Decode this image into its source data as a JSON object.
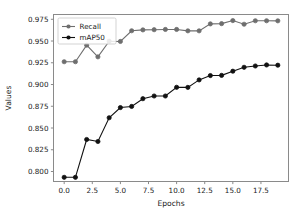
{
  "chart_data": {
    "type": "line",
    "title": "",
    "xlabel": "Epochs",
    "ylabel": "Values",
    "xlim": [
      -0.95,
      19.95
    ],
    "ylim": [
      0.7885,
      0.9805
    ],
    "xticks": [
      0.0,
      2.5,
      5.0,
      7.5,
      10.0,
      12.5,
      15.0,
      17.5
    ],
    "xticklabels": [
      "0.0",
      "2.5",
      "5.0",
      "7.5",
      "10.0",
      "12.5",
      "15.0",
      "17.5"
    ],
    "yticks": [
      0.8,
      0.825,
      0.85,
      0.875,
      0.9,
      0.925,
      0.95,
      0.975
    ],
    "yticklabels": [
      "0.800",
      "0.825",
      "0.850",
      "0.875",
      "0.900",
      "0.925",
      "0.950",
      "0.975"
    ],
    "grid": false,
    "legend_position": "upper left",
    "x": [
      0,
      1,
      2,
      3,
      4,
      5,
      6,
      7,
      8,
      9,
      10,
      11,
      12,
      13,
      14,
      15,
      16,
      17,
      18,
      19
    ],
    "series": [
      {
        "name": "Recall",
        "color": "#6e6e6e",
        "marker": "circle",
        "values": [
          0.9262,
          0.9262,
          0.9452,
          0.9318,
          0.9498,
          0.9495,
          0.9618,
          0.9628,
          0.963,
          0.9633,
          0.9633,
          0.9617,
          0.9617,
          0.9697,
          0.97,
          0.9735,
          0.9693,
          0.9733,
          0.9733,
          0.9732
        ]
      },
      {
        "name": "mAP50",
        "color": "#111111",
        "marker": "circle",
        "values": [
          0.7933,
          0.7933,
          0.8368,
          0.8345,
          0.8618,
          0.8735,
          0.8748,
          0.8837,
          0.8868,
          0.8868,
          0.8968,
          0.8967,
          0.9053,
          0.9103,
          0.9105,
          0.9153,
          0.9198,
          0.9213,
          0.9225,
          0.9222
        ]
      }
    ]
  },
  "legend": {
    "entries": [
      {
        "label": "Recall"
      },
      {
        "label": "mAP50"
      }
    ]
  }
}
